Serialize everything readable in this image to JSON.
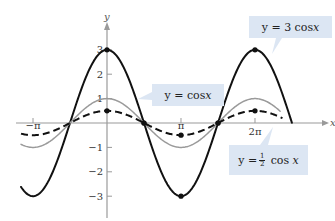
{
  "chart_data": {
    "type": "line",
    "title": "",
    "xlabel": "x",
    "ylabel": "y",
    "xlim": [
      -3.6,
      7.9
    ],
    "ylim": [
      -3.5,
      3.8
    ],
    "grid": false,
    "x_ticks": [
      {
        "value": -3.14159,
        "label": "−π"
      },
      {
        "value": 3.14159,
        "label": "π"
      },
      {
        "value": 6.28318,
        "label": "2π"
      }
    ],
    "y_ticks": [
      {
        "value": 3,
        "label": "3"
      },
      {
        "value": 2,
        "label": "2"
      },
      {
        "value": 1,
        "label": "1"
      },
      {
        "value": -1,
        "label": "−1"
      },
      {
        "value": -2,
        "label": "−2"
      },
      {
        "value": -3,
        "label": "−3"
      }
    ],
    "series": [
      {
        "name": "y = 3 cos x",
        "amplitude": 3,
        "style": "solid",
        "color": "#111111",
        "width": 2,
        "key_points": [
          [
            0,
            3
          ],
          [
            1.5708,
            0
          ],
          [
            3.14159,
            -3
          ],
          [
            4.7124,
            0
          ],
          [
            6.28318,
            3
          ]
        ]
      },
      {
        "name": "y = cos x",
        "amplitude": 1,
        "style": "solid",
        "color": "#9a9a9a",
        "width": 1.5,
        "key_points": [
          [
            0,
            1
          ],
          [
            1.5708,
            0
          ],
          [
            3.14159,
            -1
          ],
          [
            4.7124,
            0
          ],
          [
            6.28318,
            1
          ]
        ]
      },
      {
        "name": "y = ½ cos x",
        "amplitude": 0.5,
        "style": "dashed",
        "color": "#111111",
        "width": 2,
        "key_points": [
          [
            0,
            0.5
          ],
          [
            1.5708,
            0
          ],
          [
            3.14159,
            -0.5
          ],
          [
            4.7124,
            0
          ],
          [
            6.28318,
            0.5
          ]
        ]
      }
    ],
    "annotations": [
      {
        "text": "y = 3 cos x",
        "points_to": "y = 3 cos x"
      },
      {
        "text": "y = cos x",
        "points_to": "y = cos x"
      },
      {
        "text": "y = ½ cos x",
        "points_to": "y = ½ cos x"
      }
    ],
    "legend_position": "callouts"
  },
  "labels": {
    "y_axis": "y",
    "x_axis": "x",
    "callout_3cos": {
      "prefix": "y = 3 cos ",
      "var": "x"
    },
    "callout_cos": {
      "prefix": "y = cos ",
      "var": "x"
    },
    "callout_half": {
      "prefix": "y = ",
      "num": "1",
      "den": "2",
      "mid": " cos ",
      "var": "x"
    }
  }
}
